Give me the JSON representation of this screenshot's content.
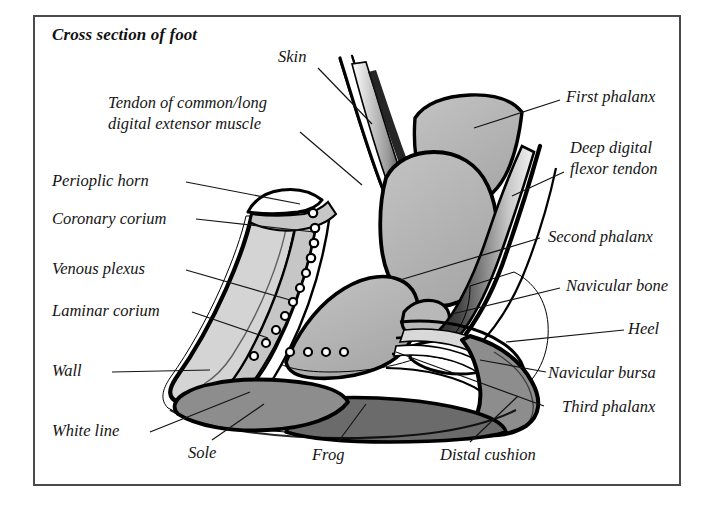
{
  "figure": {
    "title": "Cross section of foot",
    "frame_color": "#4a4a4e",
    "background": "#ffffff"
  },
  "palette": {
    "outline": "#000000",
    "bone_gray": "#b2b2b2",
    "wall_light_gray": "#d4d4d4",
    "sole_mid_gray": "#8d8d8d",
    "frog_dark_gray": "#6b6b6b",
    "corium_gray": "#c6c6c6",
    "white": "#ffffff",
    "text": "#141414"
  },
  "labels": {
    "skin": "Skin",
    "tendon_extensor": "Tendon of common/long\ndigital extensor muscle",
    "tendon_extensor_line1": "Tendon of common/long",
    "tendon_extensor_line2": "digital extensor muscle",
    "first_phalanx": "First phalanx",
    "deep_digital_flexor_tendon_line1": "Deep digital",
    "deep_digital_flexor_tendon_line2": "flexor tendon",
    "perioplic_horn": "Perioplic horn",
    "coronary_corium": "Coronary corium",
    "second_phalanx": "Second phalanx",
    "venous_plexus": "Venous plexus",
    "navicular_bone": "Navicular bone",
    "laminar_corium": "Laminar corium",
    "heel": "Heel",
    "navicular_bursa": "Navicular bursa",
    "wall": "Wall",
    "third_phalanx": "Third phalanx",
    "white_line": "White line",
    "sole": "Sole",
    "frog": "Frog",
    "distal_cushion": "Distal cushion"
  },
  "diagram_parts": [
    {
      "name": "skin",
      "shading": "white with black outline",
      "region": "outer dorsal strip"
    },
    {
      "name": "tendon-of-common-long-digital-extensor-muscle",
      "shading": "white/black gradient strip",
      "region": "dorsal, beneath skin"
    },
    {
      "name": "first-phalanx",
      "shading": "bone_gray",
      "region": "upper right bone"
    },
    {
      "name": "second-phalanx",
      "shading": "bone_gray",
      "region": "central large bone"
    },
    {
      "name": "third-phalanx",
      "shading": "bone_gray",
      "region": "lower central bone (coffin bone)"
    },
    {
      "name": "navicular-bone",
      "shading": "bone_gray",
      "region": "small bone behind third phalanx"
    },
    {
      "name": "navicular-bursa",
      "shading": "white",
      "region": "sac beneath navicular bone"
    },
    {
      "name": "deep-digital-flexor-tendon",
      "shading": "dark gradient band",
      "region": "palmar, running to third phalanx"
    },
    {
      "name": "perioplic-horn",
      "shading": "white wedge",
      "region": "coronary band top of wall"
    },
    {
      "name": "coronary-corium",
      "shading": "corium_gray",
      "region": "under perioplic horn"
    },
    {
      "name": "venous-plexus",
      "shading": "chain of small ring circles",
      "region": "along laminar/coronary border"
    },
    {
      "name": "laminar-corium",
      "shading": "corium_gray",
      "region": "inner face of wall"
    },
    {
      "name": "wall",
      "shading": "wall_light_gray",
      "region": "hoof wall, dorsal/outer"
    },
    {
      "name": "white-line",
      "shading": "white stripe",
      "region": "junction of wall and sole"
    },
    {
      "name": "sole",
      "shading": "sole_mid_gray",
      "region": "ground surface front"
    },
    {
      "name": "frog",
      "shading": "frog_dark_gray",
      "region": "ground surface rear, wedge"
    },
    {
      "name": "distal-cushion",
      "shading": "sole_mid_gray",
      "region": "heel bulb, digital cushion"
    },
    {
      "name": "heel",
      "shading": "layered bands",
      "region": "caudal hoof, bulb"
    }
  ]
}
